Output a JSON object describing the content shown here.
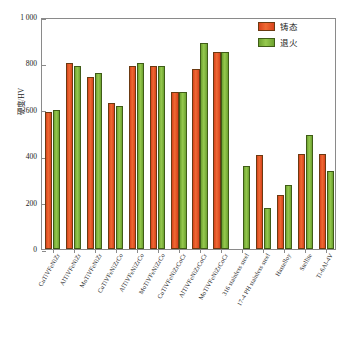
{
  "chart_data": {
    "type": "bar",
    "title": "",
    "xlabel": "",
    "ylabel": "硬度/HV",
    "ylim": [
      0,
      1000
    ],
    "yticks": [
      "0",
      "200",
      "400",
      "600",
      "800",
      "1 000"
    ],
    "ytick_values": [
      0,
      200,
      400,
      600,
      800,
      1000
    ],
    "grid": false,
    "legend_position": "top-right",
    "categories": [
      "CuTiVFeNiZr",
      "AlTiVFeNiZr",
      "MoTiVFeNiZr",
      "CuTiVFeNiZrCo",
      "AlTiVFeNiZrCo",
      "MoTiVFeNiZrCo",
      "CuTiVFeNiZrCoCr",
      "AlTiVFeNiZrCoCr",
      "MoTiVFeNiZrCoCr",
      "316 stainless steel",
      "17-4 PH stainless steel",
      "Hastelloy",
      "Stellite",
      "Ti-6Al-4V"
    ],
    "series": [
      {
        "name": "铸态",
        "color": "#e8502a",
        "values": [
          590,
          800,
          740,
          628,
          790,
          788,
          676,
          778,
          849,
          null,
          407,
          233,
          411,
          409
        ]
      },
      {
        "name": "退火",
        "color": "#8cbf43",
        "values": [
          600,
          790,
          760,
          617,
          800,
          788,
          676,
          889,
          848,
          357,
          178,
          277,
          491,
          338
        ]
      }
    ]
  },
  "legend": {
    "items": [
      {
        "label": "铸态",
        "swatch": "cast"
      },
      {
        "label": "退火",
        "swatch": "ann"
      }
    ]
  }
}
